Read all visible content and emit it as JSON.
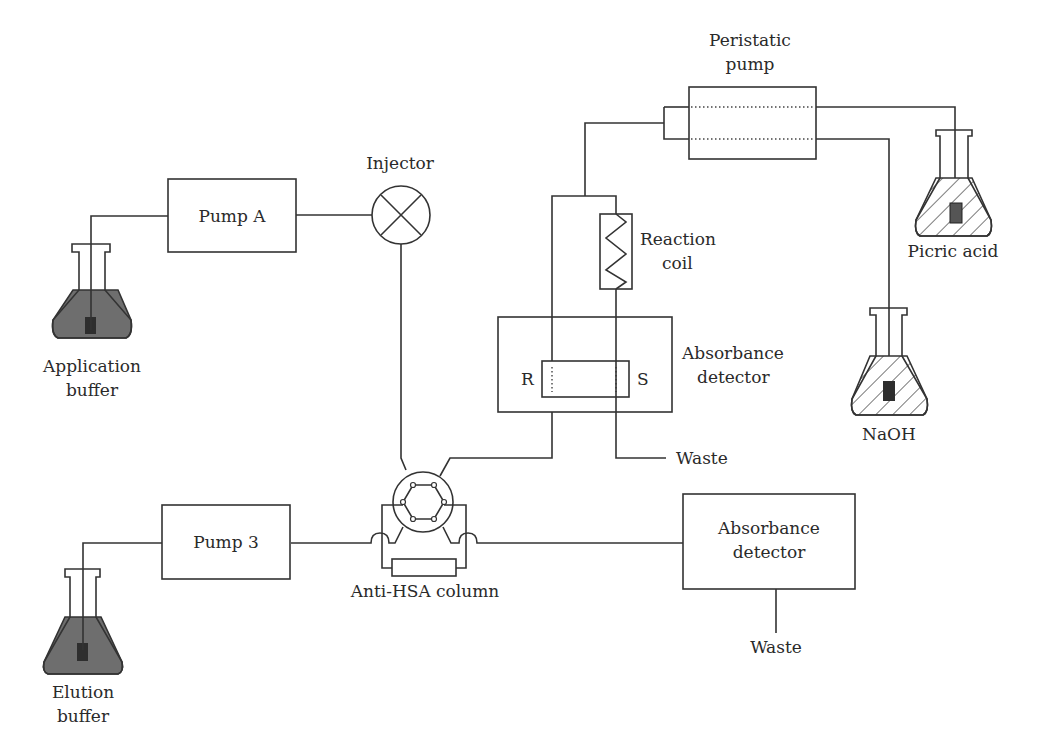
{
  "diagram": {
    "type": "flow-schematic",
    "labels": {
      "pump_a": "Pump A",
      "pump_3": "Pump 3",
      "injector": "Injector",
      "peristaltic_line1": "Peristatic",
      "peristaltic_line2": "pump",
      "reaction_line1": "Reaction",
      "reaction_line2": "coil",
      "abs1_line1": "Absorbance",
      "abs1_line2": "detector",
      "abs2_line1": "Absorbance",
      "abs2_line2": "detector",
      "ref_cell": "R",
      "sample_cell": "S",
      "waste_1": "Waste",
      "waste_2": "Waste",
      "column": "Anti-HSA column",
      "app_buffer_line1": "Application",
      "app_buffer_line2": "buffer",
      "elution_line1": "Elution",
      "elution_line2": "buffer",
      "picric": "Picric acid",
      "naoh": "NaOH"
    },
    "nodes": [
      {
        "id": "application-buffer",
        "kind": "flask",
        "fill": "dark"
      },
      {
        "id": "pump-a",
        "kind": "box"
      },
      {
        "id": "injector",
        "kind": "valve"
      },
      {
        "id": "six-port-valve",
        "kind": "valve"
      },
      {
        "id": "anti-hsa-column",
        "kind": "column"
      },
      {
        "id": "elution-buffer",
        "kind": "flask",
        "fill": "dark"
      },
      {
        "id": "pump-3",
        "kind": "box"
      },
      {
        "id": "absorbance-detector-2",
        "kind": "box"
      },
      {
        "id": "absorbance-detector-1",
        "kind": "box"
      },
      {
        "id": "reaction-coil",
        "kind": "coil"
      },
      {
        "id": "peristaltic-pump",
        "kind": "box"
      },
      {
        "id": "picric-acid",
        "kind": "flask",
        "fill": "hatched"
      },
      {
        "id": "naoh",
        "kind": "flask",
        "fill": "hatched"
      }
    ],
    "edges": [
      [
        "application-buffer",
        "pump-a"
      ],
      [
        "pump-a",
        "injector"
      ],
      [
        "injector",
        "six-port-valve"
      ],
      [
        "elution-buffer",
        "pump-3"
      ],
      [
        "pump-3",
        "six-port-valve"
      ],
      [
        "six-port-valve",
        "anti-hsa-column"
      ],
      [
        "six-port-valve",
        "absorbance-detector-2"
      ],
      [
        "absorbance-detector-2",
        "waste"
      ],
      [
        "six-port-valve",
        "absorbance-detector-1"
      ],
      [
        "picric-acid",
        "peristaltic-pump"
      ],
      [
        "naoh",
        "peristaltic-pump"
      ],
      [
        "peristaltic-pump",
        "reaction-coil"
      ],
      [
        "reaction-coil",
        "absorbance-detector-1"
      ],
      [
        "absorbance-detector-1",
        "waste"
      ]
    ],
    "colors": {
      "line": "#333333",
      "dark_liquid": "#6e6e6e",
      "background": "#ffffff"
    }
  }
}
